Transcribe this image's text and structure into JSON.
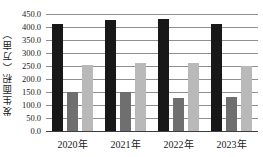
{
  "chart_data": {
    "type": "bar",
    "title": "",
    "xlabel": "",
    "ylabel": "发生面积（万亩）",
    "categories": [
      "2020年",
      "2021年",
      "2022年",
      "2023年"
    ],
    "series": [
      {
        "name": "series-1",
        "color": "#181818",
        "values": [
          410,
          425,
          430,
          412
        ]
      },
      {
        "name": "series-2",
        "color": "#6f6f6f",
        "values": [
          150,
          150,
          125,
          132
        ]
      },
      {
        "name": "series-3",
        "color": "#b9b9b9",
        "values": [
          255,
          262,
          260,
          250
        ]
      }
    ],
    "ylim": [
      0,
      450
    ],
    "ytick_step": 50,
    "ytick_labels": [
      "450.0",
      "400.0",
      "350.0",
      "300.0",
      "250.0",
      "200.0",
      "150.0",
      "100.0",
      "50.0",
      "0.0"
    ],
    "grid": true,
    "legend_position": "none"
  },
  "colors": {
    "background": "#ffffff",
    "gridline": "#8f8f8f",
    "axis_line": "#3d3d3d",
    "text": "#1a1a1a"
  }
}
